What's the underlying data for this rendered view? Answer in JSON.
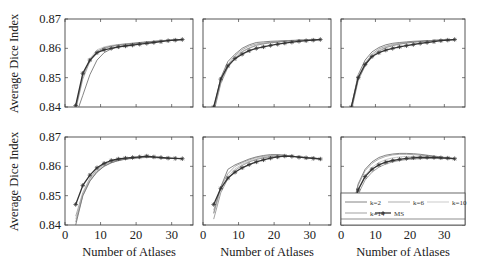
{
  "figure": {
    "ylabel": "Average Dice Index",
    "xlabel": "Number of Atlases",
    "legend": {
      "entries": [
        "k=2",
        "k=6",
        "k=10",
        "k=14",
        "MS"
      ]
    },
    "colors": {
      "axis": "#444444",
      "ms_line": "#333333",
      "k2": "#666666",
      "k6": "#8a8a8a",
      "k10": "#a8a8a8",
      "k14": "#7a7a7a"
    }
  },
  "chart_data": [
    {
      "type": "line",
      "panel": "top-left",
      "xlabel": "",
      "ylabel": "Average Dice Index",
      "xlim": [
        0,
        36
      ],
      "ylim": [
        0.84,
        0.87
      ],
      "yticks": [
        0.84,
        0.85,
        0.86,
        0.87
      ],
      "xticks": [],
      "grid": false,
      "x": [
        3,
        5,
        7,
        9,
        11,
        13,
        15,
        17,
        19,
        21,
        23,
        25,
        27,
        29,
        31,
        33
      ],
      "series": [
        {
          "name": "k=2",
          "values": [
            0.837,
            0.844,
            0.851,
            0.856,
            0.8585,
            0.8598,
            0.8605,
            0.861,
            0.8614,
            0.8618,
            0.862,
            0.8623,
            0.8625,
            0.8627,
            0.8629,
            0.863
          ]
        },
        {
          "name": "k=6",
          "values": [
            0.839,
            0.8495,
            0.8555,
            0.8585,
            0.86,
            0.8606,
            0.861,
            0.8613,
            0.8616,
            0.8619,
            0.8621,
            0.8623,
            0.8625,
            0.8627,
            0.8628,
            0.863
          ]
        },
        {
          "name": "k=10",
          "values": [
            0.84,
            0.851,
            0.8565,
            0.8595,
            0.8605,
            0.861,
            0.8613,
            0.8615,
            0.8618,
            0.862,
            0.8622,
            0.8624,
            0.8626,
            0.8627,
            0.8629,
            0.863
          ]
        },
        {
          "name": "k=14",
          "values": [
            0.8395,
            0.8505,
            0.856,
            0.859,
            0.8602,
            0.8608,
            0.8612,
            0.8615,
            0.8617,
            0.862,
            0.8622,
            0.8624,
            0.8626,
            0.8628,
            0.8629,
            0.863
          ]
        },
        {
          "name": "MS",
          "values": [
            0.8405,
            0.8515,
            0.856,
            0.8585,
            0.8595,
            0.86,
            0.8605,
            0.8608,
            0.8611,
            0.8614,
            0.8617,
            0.862,
            0.8623,
            0.8626,
            0.8628,
            0.863
          ]
        }
      ]
    },
    {
      "type": "line",
      "panel": "top-middle",
      "xlim": [
        0,
        36
      ],
      "ylim": [
        0.84,
        0.87
      ],
      "yticks": [
        0.84,
        0.85,
        0.86,
        0.87
      ],
      "xticks": [],
      "x": [
        3,
        5,
        7,
        9,
        11,
        13,
        15,
        17,
        19,
        21,
        23,
        25,
        27,
        29,
        31,
        33
      ],
      "series": [
        {
          "name": "k=2",
          "values": [
            0.839,
            0.85,
            0.8555,
            0.858,
            0.86,
            0.8612,
            0.862,
            0.8622,
            0.8624,
            0.8625,
            0.8626,
            0.8627,
            0.8628,
            0.8628,
            0.8629,
            0.863
          ]
        },
        {
          "name": "k=6",
          "values": [
            0.8395,
            0.8495,
            0.8545,
            0.8575,
            0.8595,
            0.8608,
            0.8615,
            0.8618,
            0.8621,
            0.8623,
            0.8625,
            0.8626,
            0.8627,
            0.8628,
            0.8629,
            0.863
          ]
        },
        {
          "name": "k=10",
          "values": [
            0.8385,
            0.8485,
            0.854,
            0.857,
            0.859,
            0.8602,
            0.8612,
            0.8617,
            0.862,
            0.8622,
            0.8624,
            0.8626,
            0.8627,
            0.8628,
            0.8629,
            0.863
          ]
        },
        {
          "name": "k=14",
          "values": [
            0.838,
            0.848,
            0.8535,
            0.8565,
            0.8588,
            0.86,
            0.861,
            0.8615,
            0.8619,
            0.8621,
            0.8624,
            0.8625,
            0.8627,
            0.8628,
            0.8629,
            0.863
          ]
        },
        {
          "name": "MS",
          "values": [
            0.84,
            0.8495,
            0.854,
            0.8565,
            0.858,
            0.8592,
            0.86,
            0.8605,
            0.861,
            0.8614,
            0.8618,
            0.8621,
            0.8624,
            0.8626,
            0.8628,
            0.863
          ]
        }
      ]
    },
    {
      "type": "line",
      "panel": "top-right",
      "xlim": [
        0,
        36
      ],
      "ylim": [
        0.84,
        0.87
      ],
      "yticks": [
        0.84,
        0.85,
        0.86,
        0.87
      ],
      "xticks": [],
      "x": [
        3,
        5,
        7,
        9,
        11,
        13,
        15,
        17,
        19,
        21,
        23,
        25,
        27,
        29,
        31,
        33
      ],
      "series": [
        {
          "name": "k=2",
          "values": [
            0.84,
            0.851,
            0.856,
            0.8588,
            0.8603,
            0.8612,
            0.8617,
            0.862,
            0.8622,
            0.8624,
            0.8625,
            0.8626,
            0.8627,
            0.8628,
            0.8629,
            0.863
          ]
        },
        {
          "name": "k=6",
          "values": [
            0.8395,
            0.85,
            0.855,
            0.858,
            0.8598,
            0.8607,
            0.8613,
            0.8617,
            0.862,
            0.8622,
            0.8624,
            0.8626,
            0.8627,
            0.8628,
            0.8629,
            0.863
          ]
        },
        {
          "name": "k=10",
          "values": [
            0.839,
            0.8495,
            0.8545,
            0.8575,
            0.8594,
            0.8604,
            0.8611,
            0.8615,
            0.8618,
            0.8621,
            0.8623,
            0.8625,
            0.8627,
            0.8628,
            0.8629,
            0.863
          ]
        },
        {
          "name": "k=14",
          "values": [
            0.8385,
            0.849,
            0.854,
            0.8572,
            0.859,
            0.8602,
            0.8609,
            0.8614,
            0.8618,
            0.8621,
            0.8623,
            0.8625,
            0.8627,
            0.8628,
            0.8629,
            0.863
          ]
        },
        {
          "name": "MS",
          "values": [
            0.84,
            0.85,
            0.8545,
            0.8572,
            0.8585,
            0.8594,
            0.86,
            0.8605,
            0.8609,
            0.8613,
            0.8617,
            0.862,
            0.8623,
            0.8626,
            0.8628,
            0.863
          ]
        }
      ]
    },
    {
      "type": "line",
      "panel": "bottom-left",
      "xlabel": "Number of Atlases",
      "ylabel": "Average Dice Index",
      "xlim": [
        0,
        36
      ],
      "ylim": [
        0.84,
        0.87
      ],
      "yticks": [
        0.84,
        0.85,
        0.86,
        0.87
      ],
      "xticks": [
        0,
        10,
        20,
        30
      ],
      "x": [
        3,
        5,
        7,
        9,
        11,
        13,
        15,
        17,
        19,
        21,
        23,
        25,
        27,
        29,
        31,
        33
      ],
      "series": [
        {
          "name": "k=2",
          "values": [
            0.84,
            0.85,
            0.855,
            0.858,
            0.86,
            0.8612,
            0.862,
            0.8625,
            0.8628,
            0.863,
            0.8631,
            0.863,
            0.8629,
            0.8628,
            0.8627,
            0.8626
          ]
        },
        {
          "name": "k=6",
          "values": [
            0.843,
            0.851,
            0.856,
            0.859,
            0.8606,
            0.8616,
            0.8622,
            0.8626,
            0.8628,
            0.863,
            0.8631,
            0.863,
            0.8629,
            0.8628,
            0.8627,
            0.8626
          ]
        },
        {
          "name": "k=10",
          "values": [
            0.842,
            0.8505,
            0.8555,
            0.8585,
            0.8603,
            0.8614,
            0.8621,
            0.8625,
            0.8628,
            0.863,
            0.863,
            0.863,
            0.8629,
            0.8628,
            0.8627,
            0.8626
          ]
        },
        {
          "name": "k=14",
          "values": [
            0.841,
            0.85,
            0.855,
            0.8582,
            0.86,
            0.8612,
            0.862,
            0.8624,
            0.8627,
            0.8629,
            0.863,
            0.863,
            0.8629,
            0.8628,
            0.8627,
            0.8626
          ]
        },
        {
          "name": "MS",
          "values": [
            0.847,
            0.8535,
            0.857,
            0.8595,
            0.861,
            0.862,
            0.8625,
            0.8628,
            0.863,
            0.8632,
            0.8635,
            0.8632,
            0.863,
            0.8628,
            0.8627,
            0.8626
          ]
        }
      ]
    },
    {
      "type": "line",
      "panel": "bottom-middle",
      "xlabel": "Number of Atlases",
      "xlim": [
        0,
        36
      ],
      "ylim": [
        0.84,
        0.87
      ],
      "yticks": [
        0.84,
        0.85,
        0.86,
        0.87
      ],
      "xticks": [
        0,
        10,
        20,
        30
      ],
      "x": [
        3,
        5,
        7,
        9,
        11,
        13,
        15,
        17,
        19,
        21,
        23,
        25,
        27,
        29,
        31,
        33
      ],
      "series": [
        {
          "name": "k=2",
          "values": [
            0.844,
            0.853,
            0.859,
            0.8605,
            0.8615,
            0.8625,
            0.8632,
            0.8637,
            0.864,
            0.864,
            0.8638,
            0.8635,
            0.8632,
            0.863,
            0.8628,
            0.8626
          ]
        },
        {
          "name": "k=6",
          "values": [
            0.845,
            0.853,
            0.8575,
            0.86,
            0.8612,
            0.8622,
            0.863,
            0.8634,
            0.8637,
            0.8638,
            0.8637,
            0.8635,
            0.8632,
            0.863,
            0.8628,
            0.8626
          ]
        },
        {
          "name": "k=10",
          "values": [
            0.844,
            0.852,
            0.8565,
            0.8592,
            0.8607,
            0.8618,
            0.8626,
            0.8631,
            0.8634,
            0.8636,
            0.8636,
            0.8634,
            0.8632,
            0.863,
            0.8628,
            0.8626
          ]
        },
        {
          "name": "k=14",
          "values": [
            0.842,
            0.851,
            0.8558,
            0.8586,
            0.8603,
            0.8615,
            0.8623,
            0.8629,
            0.8632,
            0.8634,
            0.8635,
            0.8634,
            0.8632,
            0.863,
            0.8628,
            0.8626
          ]
        },
        {
          "name": "MS",
          "values": [
            0.847,
            0.8525,
            0.856,
            0.858,
            0.8595,
            0.8606,
            0.8615,
            0.8622,
            0.8628,
            0.8632,
            0.8635,
            0.8634,
            0.8631,
            0.8629,
            0.8627,
            0.8625
          ]
        }
      ]
    },
    {
      "type": "line",
      "panel": "bottom-right",
      "xlabel": "Number of Atlases",
      "xlim": [
        0,
        36
      ],
      "ylim": [
        0.84,
        0.87
      ],
      "yticks": [
        0.84,
        0.85,
        0.86,
        0.87
      ],
      "xticks": [
        0,
        10,
        20,
        30
      ],
      "legend_position": "lower-center (inside, full width)",
      "x": [
        3,
        5,
        7,
        9,
        11,
        13,
        15,
        17,
        19,
        21,
        23,
        25,
        27,
        29,
        31,
        33
      ],
      "series": [
        {
          "name": "k=2",
          "values": [
            0.844,
            0.854,
            0.859,
            0.8615,
            0.863,
            0.8638,
            0.8642,
            0.8644,
            0.8644,
            0.8643,
            0.8641,
            0.8638,
            0.8635,
            0.8632,
            0.8629,
            0.8626
          ]
        },
        {
          "name": "k=6",
          "values": [
            0.844,
            0.8535,
            0.8585,
            0.861,
            0.8625,
            0.8634,
            0.8639,
            0.8641,
            0.8641,
            0.864,
            0.8638,
            0.8636,
            0.8633,
            0.863,
            0.8628,
            0.8626
          ]
        },
        {
          "name": "k=10",
          "values": [
            0.843,
            0.852,
            0.857,
            0.8597,
            0.8613,
            0.8623,
            0.8629,
            0.8632,
            0.8634,
            0.8634,
            0.8633,
            0.8632,
            0.863,
            0.8629,
            0.8627,
            0.8626
          ]
        },
        {
          "name": "k=14",
          "values": [
            0.842,
            0.8505,
            0.8553,
            0.858,
            0.8597,
            0.8608,
            0.8615,
            0.862,
            0.8623,
            0.8625,
            0.8626,
            0.8627,
            0.8627,
            0.8627,
            0.8626,
            0.8625
          ]
        },
        {
          "name": "MS",
          "values": [
            0.844,
            0.852,
            0.8565,
            0.859,
            0.8605,
            0.8614,
            0.862,
            0.8624,
            0.8627,
            0.8629,
            0.863,
            0.863,
            0.863,
            0.8629,
            0.8628,
            0.8626
          ]
        }
      ]
    }
  ]
}
